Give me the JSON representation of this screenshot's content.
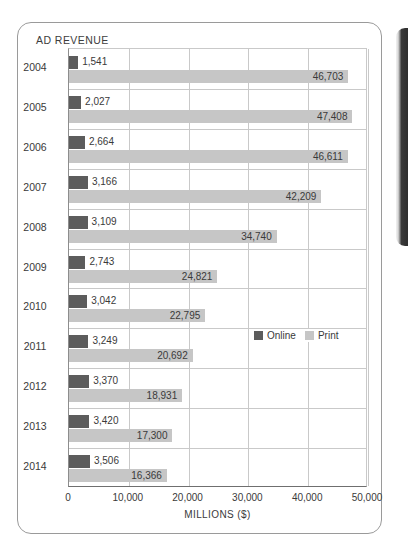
{
  "figure": {
    "title": "AD REVENUE"
  },
  "legend": {
    "position": "inside-right-middle",
    "items": [
      {
        "label": "Online",
        "color": "#5c5c5c"
      },
      {
        "label": "Print",
        "color": "#c6c6c6"
      }
    ]
  },
  "axis": {
    "x_title": "MILLIONS ($)",
    "x_ticks": [
      "0",
      "10,000",
      "20,000",
      "30,000",
      "40,000",
      "50,000"
    ]
  },
  "chart_data": {
    "type": "bar",
    "orientation": "horizontal",
    "title": "AD REVENUE",
    "xlabel": "MILLIONS ($)",
    "ylabel": "",
    "xlim": [
      0,
      50000
    ],
    "xticks": [
      0,
      10000,
      20000,
      30000,
      40000,
      50000
    ],
    "grid": true,
    "legend_position": "inside-right-middle",
    "categories": [
      "2004",
      "2005",
      "2006",
      "2007",
      "2008",
      "2009",
      "2010",
      "2011",
      "2012",
      "2013",
      "2014"
    ],
    "series": [
      {
        "name": "Online",
        "color": "#5c5c5c",
        "values": [
          1541,
          2027,
          2664,
          3166,
          3109,
          2743,
          3042,
          3249,
          3370,
          3420,
          3506
        ],
        "labels": [
          "1,541",
          "2,027",
          "2,664",
          "3,166",
          "3,109",
          "2,743",
          "3,042",
          "3,249",
          "3,370",
          "3,420",
          "3,506"
        ]
      },
      {
        "name": "Print",
        "color": "#c6c6c6",
        "values": [
          46703,
          47408,
          46611,
          42209,
          34740,
          24821,
          22795,
          20692,
          18931,
          17300,
          16366
        ],
        "labels": [
          "46,703",
          "47,408",
          "46,611",
          "42,209",
          "34,740",
          "24,821",
          "22,795",
          "20,692",
          "18,931",
          "17,300",
          "16,366"
        ]
      }
    ]
  }
}
